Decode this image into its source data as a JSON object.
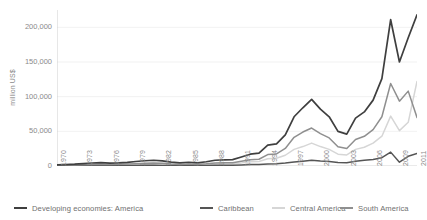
{
  "chart_data": {
    "type": "line",
    "title": "",
    "xlabel": "",
    "ylabel": "million US$",
    "ylim": [
      0,
      225000
    ],
    "yticks": [
      "0",
      "50,000",
      "100,000",
      "150,000",
      "200,000"
    ],
    "ytick_values": [
      0,
      50000,
      100000,
      150000,
      200000
    ],
    "grid": true,
    "legend_position": "bottom",
    "x": [
      1970,
      1971,
      1972,
      1973,
      1974,
      1975,
      1976,
      1977,
      1978,
      1979,
      1980,
      1981,
      1982,
      1983,
      1984,
      1985,
      1986,
      1987,
      1988,
      1989,
      1990,
      1991,
      1992,
      1993,
      1994,
      1995,
      1996,
      1997,
      1998,
      1999,
      2000,
      2001,
      2002,
      2003,
      2004,
      2005,
      2006,
      2007,
      2008,
      2009,
      2010,
      2011
    ],
    "xtick_labels": [
      "1970",
      "1973",
      "1976",
      "1979",
      "1982",
      "1985",
      "1988",
      "1991",
      "1994",
      "1997",
      "2000",
      "2003",
      "2006",
      "2009",
      "2011"
    ],
    "xtick_years": [
      1970,
      1973,
      1976,
      1979,
      1982,
      1985,
      1988,
      1991,
      1994,
      1997,
      2000,
      2003,
      2006,
      2009,
      2011
    ],
    "series": [
      {
        "name": "Developing economies: America",
        "color": "#3f3f3f",
        "values": [
          1700,
          2100,
          2600,
          3400,
          4300,
          4800,
          4200,
          4500,
          5300,
          6500,
          7600,
          8300,
          7500,
          5500,
          4600,
          5400,
          4500,
          6100,
          8300,
          8800,
          9200,
          13000,
          17000,
          18500,
          30000,
          32000,
          45000,
          71000,
          84000,
          96000,
          82000,
          71000,
          50000,
          46000,
          69000,
          78000,
          95000,
          126000,
          211000,
          150000,
          185000,
          218000
        ]
      },
      {
        "name": "Caribbean",
        "color": "#555555",
        "values": [
          200,
          250,
          300,
          400,
          500,
          550,
          500,
          550,
          650,
          800,
          950,
          1000,
          900,
          700,
          600,
          700,
          600,
          800,
          1000,
          1100,
          1200,
          1600,
          2100,
          2300,
          3000,
          3400,
          4200,
          5600,
          7000,
          8200,
          7200,
          6500,
          5200,
          4800,
          6800,
          8200,
          9500,
          12000,
          20000,
          5500,
          14000,
          18000
        ]
      },
      {
        "name": "Central America",
        "color": "#d6d6d6",
        "values": [
          600,
          750,
          900,
          1200,
          1500,
          1700,
          1500,
          1600,
          1900,
          2300,
          2700,
          2900,
          2600,
          2000,
          1700,
          1900,
          1700,
          2200,
          2900,
          3100,
          3300,
          4500,
          6000,
          6500,
          10500,
          11200,
          15500,
          24000,
          28000,
          33000,
          28000,
          24000,
          17000,
          16000,
          24000,
          27000,
          33000,
          43000,
          72000,
          51000,
          63000,
          122000
        ]
      },
      {
        "name": "South America",
        "color": "#8f8f8f",
        "values": [
          900,
          1100,
          1400,
          1800,
          2300,
          2550,
          2200,
          2350,
          2750,
          3400,
          3950,
          4400,
          4000,
          2800,
          2300,
          2800,
          2200,
          3100,
          4400,
          4600,
          4700,
          6900,
          8900,
          9700,
          16500,
          17400,
          25300,
          41400,
          49000,
          54800,
          46800,
          40500,
          27800,
          25200,
          38200,
          42800,
          52500,
          71000,
          119000,
          93500,
          108000,
          70000
        ]
      }
    ]
  },
  "axis": {
    "y_title": "million US$"
  }
}
